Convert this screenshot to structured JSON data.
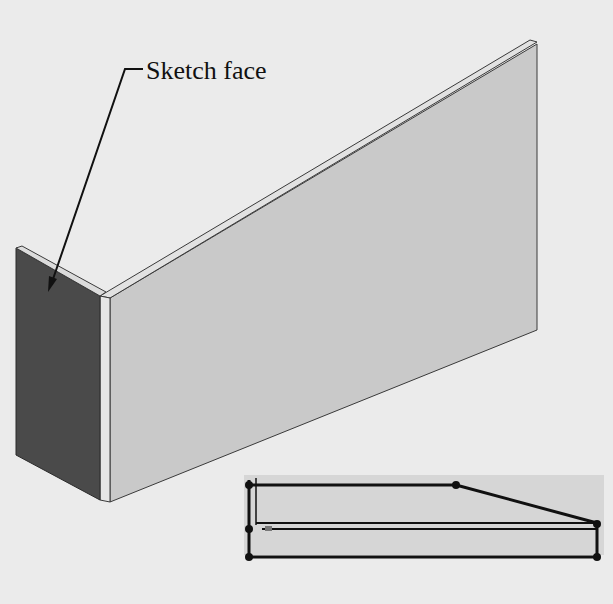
{
  "figure": {
    "callout": {
      "label": "Sketch face",
      "target": "left end face"
    },
    "model": {
      "type": "L-shaped sheet body",
      "colors": {
        "background": "#ebebeb",
        "long_face": "#c9c9c9",
        "long_face_edge": "#e2e2e2",
        "sketch_face": "#4a4a4a",
        "thickness_edge": "#e6e6e6",
        "outline": "#3a3a3a"
      }
    },
    "sketch_inset": {
      "background": "#d6d6d6",
      "line_color": "#111111",
      "point_count": 6
    }
  }
}
